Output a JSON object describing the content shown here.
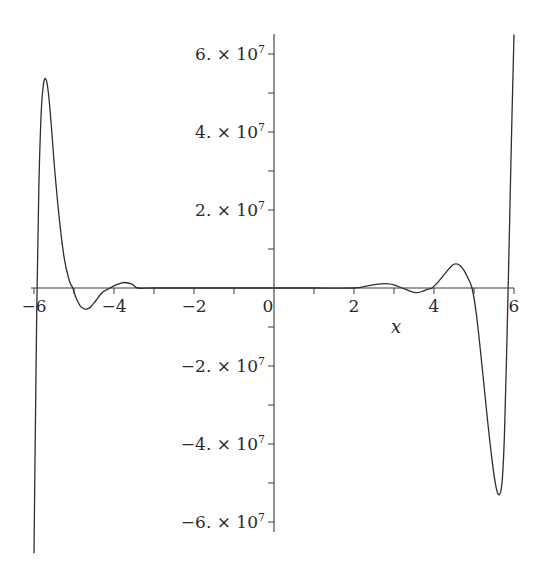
{
  "chart_data": {
    "type": "line",
    "title": "",
    "xlabel": "x",
    "ylabel": "",
    "xlim": [
      -6,
      6
    ],
    "ylim": [
      -64000000.0,
      64000000.0
    ],
    "grid": false,
    "legend": null,
    "x_ticks": [
      -6,
      -4,
      -2,
      0,
      2,
      4,
      6
    ],
    "x_tick_labels": [
      "-6",
      "-4",
      "-2",
      "0",
      "2",
      "4",
      "6"
    ],
    "x_minor_ticks": [
      -5,
      -3,
      -1,
      1,
      3,
      5
    ],
    "y_ticks": [
      60000000,
      40000000,
      20000000,
      -20000000,
      -40000000,
      -60000000
    ],
    "y_tick_labels": [
      {
        "mantissa": "6.",
        "times": "×",
        "base": "10",
        "exp": "7"
      },
      {
        "mantissa": "4.",
        "times": "×",
        "base": "10",
        "exp": "7"
      },
      {
        "mantissa": "2.",
        "times": "×",
        "base": "10",
        "exp": "7"
      },
      {
        "mantissa": "−2.",
        "times": "×",
        "base": "10",
        "exp": "7"
      },
      {
        "mantissa": "−4.",
        "times": "×",
        "base": "10",
        "exp": "7"
      },
      {
        "mantissa": "−6.",
        "times": "×",
        "base": "10",
        "exp": "7"
      }
    ],
    "y_minor_ticks": [
      50000000,
      30000000,
      10000000,
      -10000000,
      -30000000,
      -50000000
    ],
    "series": [
      {
        "name": "f(x)",
        "color": "#2e2e2e",
        "x": [
          -6.0,
          -5.97,
          -5.93,
          -5.88,
          -5.82,
          -5.76,
          -5.7,
          -5.64,
          -5.57,
          -5.48,
          -5.38,
          -5.25,
          -5.12,
          -5.03,
          -4.95,
          -4.85,
          -4.75,
          -4.68,
          -4.58,
          -4.45,
          -4.3,
          -4.1,
          -3.95,
          -3.75,
          -3.55,
          -3.4,
          -3.0,
          -2.0,
          -1.0,
          0.0,
          1.0,
          2.0,
          2.3,
          2.6,
          2.8,
          3.0,
          3.2,
          3.4,
          3.55,
          3.7,
          3.85,
          3.95,
          4.1,
          4.3,
          4.45,
          4.55,
          4.65,
          4.75,
          4.85,
          4.95,
          5.05,
          5.15,
          5.25,
          5.35,
          5.45,
          5.55,
          5.63,
          5.7,
          5.76,
          5.82,
          5.88,
          5.94,
          6.0
        ],
        "y": [
          -68000000,
          -40000000,
          -5000000,
          25000000,
          45000000,
          52500000,
          53500000,
          50000000,
          42000000,
          30000000,
          19000000,
          8000000,
          2000000,
          0,
          -2500000,
          -4500000,
          -5300000,
          -5400000,
          -4800000,
          -3200000,
          -1200000,
          0,
          800000,
          1400000,
          1000000,
          0,
          0,
          0,
          0,
          0,
          0,
          0,
          500000,
          1000000,
          1100000,
          800000,
          0,
          -800000,
          -1200000,
          -900000,
          -300000,
          0,
          1500000,
          4000000,
          5800000,
          6200000,
          5800000,
          4500000,
          2500000,
          0,
          -6000000,
          -15000000,
          -25000000,
          -35000000,
          -44000000,
          -51000000,
          -53000000,
          -50000000,
          -38000000,
          -15000000,
          12000000,
          40000000,
          65000000
        ]
      }
    ]
  }
}
